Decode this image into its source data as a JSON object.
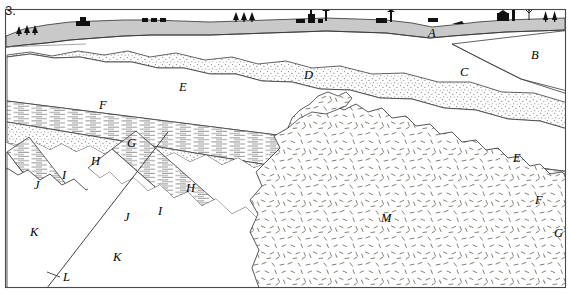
{
  "figure": {
    "number": "3.",
    "type": "geologic-cross-section",
    "frame_color": "#444444",
    "background_color": "#ffffff"
  },
  "surface": {
    "soil_layer_color": "#c9c9c9",
    "features": [
      {
        "name": "conifer-trees",
        "x": 22,
        "count": 3
      },
      {
        "name": "house",
        "x": 82
      },
      {
        "name": "houses-row",
        "x": 150,
        "count": 3
      },
      {
        "name": "conifer-trees",
        "x": 242,
        "count": 3
      },
      {
        "name": "town-buildings",
        "x": 312
      },
      {
        "name": "house",
        "x": 385
      },
      {
        "name": "house",
        "x": 455
      },
      {
        "name": "factory-with-smokestack",
        "x": 512
      },
      {
        "name": "bare-deciduous-tree",
        "x": 538
      },
      {
        "name": "conifer-trees",
        "x": 556,
        "count": 2
      }
    ]
  },
  "units": [
    {
      "id": "A",
      "label": "A",
      "pattern": "solid-gray",
      "name": "surface-soil-till",
      "x": 432,
      "y": 33
    },
    {
      "id": "B",
      "label": "B",
      "pattern": "blank",
      "name": "unit-b",
      "x": 535,
      "y": 55
    },
    {
      "id": "C",
      "label": "C",
      "pattern": "blank",
      "name": "unit-c",
      "x": 464,
      "y": 72
    },
    {
      "id": "D",
      "label": "D",
      "pattern": "stipple",
      "name": "sandstone-d",
      "x": 308,
      "y": 75
    },
    {
      "id": "E",
      "label": "E",
      "pattern": "blank",
      "name": "unit-e",
      "x": 183,
      "y": 87
    },
    {
      "id": "E2",
      "label": "E",
      "pattern": "blank",
      "name": "unit-e-right",
      "x": 517,
      "y": 158
    },
    {
      "id": "F",
      "label": "F",
      "pattern": "horizontal-lines",
      "name": "shale-f",
      "x": 103,
      "y": 105
    },
    {
      "id": "F2",
      "label": "F",
      "pattern": "horizontal-lines",
      "name": "shale-f-right",
      "x": 539,
      "y": 200
    },
    {
      "id": "G",
      "label": "G",
      "pattern": "stipple",
      "name": "sandstone-g",
      "x": 131,
      "y": 143
    },
    {
      "id": "G2",
      "label": "G",
      "pattern": "stipple",
      "name": "sandstone-g-right",
      "x": 558,
      "y": 233
    },
    {
      "id": "H",
      "label": "H",
      "pattern": "blank",
      "name": "unit-h-upper",
      "x": 95,
      "y": 161
    },
    {
      "id": "H2",
      "label": "H",
      "pattern": "blank",
      "name": "unit-h-lower",
      "x": 190,
      "y": 188
    },
    {
      "id": "I",
      "label": "I",
      "pattern": "horizontal-lines",
      "name": "shale-i-upper",
      "x": 64,
      "y": 175
    },
    {
      "id": "I2",
      "label": "I",
      "pattern": "horizontal-lines",
      "name": "shale-i-lower",
      "x": 160,
      "y": 211
    },
    {
      "id": "J",
      "label": "J",
      "pattern": "blank",
      "name": "unit-j-upper",
      "x": 38,
      "y": 185
    },
    {
      "id": "J2",
      "label": "J",
      "pattern": "blank",
      "name": "unit-j-lower",
      "x": 128,
      "y": 217
    },
    {
      "id": "K",
      "label": "K",
      "pattern": "blank",
      "name": "basement-k-left",
      "x": 34,
      "y": 232
    },
    {
      "id": "K2",
      "label": "K",
      "pattern": "blank",
      "name": "basement-k-right",
      "x": 117,
      "y": 257
    },
    {
      "id": "L",
      "label": "L",
      "pattern": "line",
      "name": "fault-l",
      "x": 66,
      "y": 277
    },
    {
      "id": "M",
      "label": "M",
      "pattern": "dashes",
      "name": "igneous-intrusion-m",
      "x": 385,
      "y": 218
    }
  ],
  "annotations": {
    "fault_leader": {
      "name": "fault-leader-line",
      "from_x": 47,
      "from_y": 272,
      "to_x": 58,
      "to_y": 276
    }
  }
}
